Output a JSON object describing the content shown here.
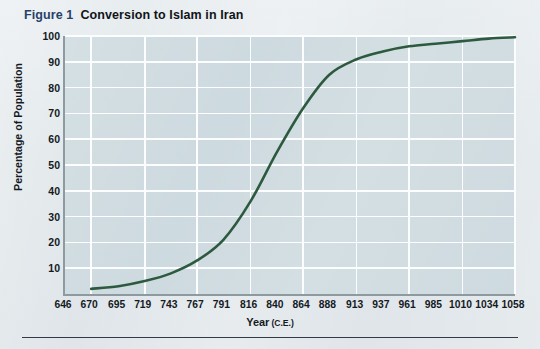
{
  "figure": {
    "number_label": "Figure 1",
    "title": "Conversion to Islam in Iran"
  },
  "colors": {
    "page_background": "#e3e9ec",
    "plot_background": "#ccd9de",
    "gridline": "#fbfdfe",
    "axis_line": "#8d9aa0",
    "curve": "#2d5a3f",
    "figure_number": "#27416b",
    "text": "#141a1f",
    "rule": "#323a46"
  },
  "chart_data": {
    "type": "line",
    "title": "Conversion to Islam in Iran",
    "xlabel": "Year",
    "xlabel_unit": "(C.E.)",
    "ylabel": "Percentage of Population",
    "xlim": [
      646,
      1058
    ],
    "ylim": [
      0,
      100
    ],
    "grid": true,
    "legend": "none",
    "x_tick_labels": [
      "646",
      "670",
      "695",
      "719",
      "743",
      "767",
      "791",
      "816",
      "840",
      "864",
      "888",
      "913",
      "937",
      "961",
      "985",
      "1010",
      "1034",
      "1058"
    ],
    "y_tick_labels": [
      "10",
      "20",
      "30",
      "40",
      "50",
      "60",
      "70",
      "80",
      "90",
      "100"
    ],
    "series": [
      {
        "name": "Percentage of population converted to Islam",
        "x": [
          670,
          695,
          719,
          743,
          767,
          791,
          816,
          840,
          864,
          888,
          913,
          937,
          961,
          985,
          1010,
          1034,
          1058
        ],
        "values": [
          2,
          3,
          5,
          8,
          13,
          21,
          36,
          55,
          72,
          85,
          91,
          94,
          96,
          97,
          98,
          99,
          99.5
        ]
      }
    ]
  }
}
